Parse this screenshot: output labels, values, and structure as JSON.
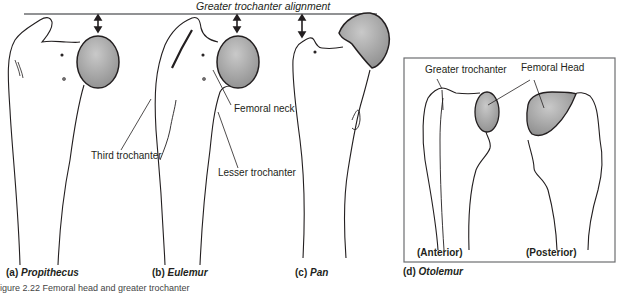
{
  "title": "Greater trochanter alignment",
  "panels": [
    {
      "id": "a",
      "prefix": "(a)",
      "taxon": "Propithecus"
    },
    {
      "id": "b",
      "prefix": "(b)",
      "taxon": "Eulemur"
    },
    {
      "id": "c",
      "prefix": "(c)",
      "taxon": "Pan"
    },
    {
      "id": "d",
      "prefix": "(d)",
      "taxon": "Otolemur"
    }
  ],
  "labels": {
    "femoral_neck": "Femoral neck",
    "third_trochanter": "Third trochanter",
    "lesser_trochanter": "Lesser trochanter",
    "greater_trochanter": "Greater trochanter",
    "femoral_head": "Femoral Head",
    "anterior": "(Anterior)",
    "posterior": "(Posterior)"
  },
  "caption": "igure 2.22 Femoral head and greater trochanter",
  "colors": {
    "head_fill": "#9a9a9a",
    "head_highlight": "#c8c8c8",
    "outline": "#231f20",
    "alignment_line": "#6d6e71"
  }
}
